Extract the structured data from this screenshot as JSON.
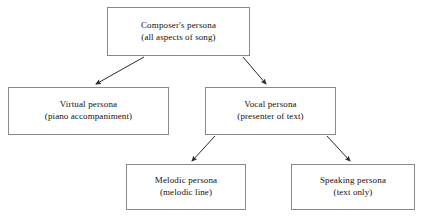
{
  "diagram": {
    "type": "hierarchy-tree",
    "background_color": "#ffffff",
    "border_color": "#8a8a8a",
    "text_color": "#111111",
    "arrow_color": "#2b2b2b",
    "nodes": [
      {
        "id": "composer",
        "title": "Composer's persona",
        "subtitle": "(all aspects of song)",
        "level": 0
      },
      {
        "id": "virtual",
        "title": "Virtual persona",
        "subtitle": "(piano accompaniment)",
        "level": 1
      },
      {
        "id": "vocal",
        "title": "Vocal persona",
        "subtitle": "(presenter of text)",
        "level": 1
      },
      {
        "id": "melodic",
        "title": "Melodic persona",
        "subtitle": "(melodic line)",
        "level": 2
      },
      {
        "id": "speaking",
        "title": "Speaking persona",
        "subtitle": "(text only)",
        "level": 2
      }
    ],
    "edges": [
      {
        "from": "composer",
        "to": "virtual",
        "style": "solid-arrow"
      },
      {
        "from": "composer",
        "to": "vocal",
        "style": "solid-arrow"
      },
      {
        "from": "vocal",
        "to": "melodic",
        "style": "solid-arrow"
      },
      {
        "from": "vocal",
        "to": "speaking",
        "style": "solid-arrow"
      }
    ]
  }
}
